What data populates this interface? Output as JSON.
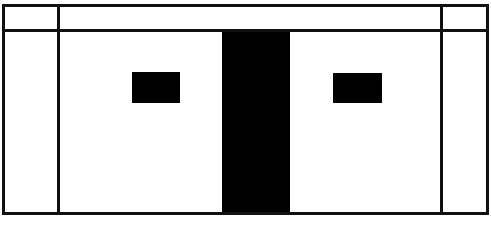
{
  "drawing": {
    "title": "Elevation Line Drawing",
    "type": "technical-line-drawing",
    "style": "monochrome black ink on white",
    "canvas": {
      "width": 491,
      "height": 228,
      "background_color": "#ffffff"
    },
    "ink_color": "#111111",
    "fill_color": "#000000",
    "line_weight": 3,
    "outer_frame": {
      "name": "outer-frame",
      "x": 3,
      "y": 5,
      "width": 484,
      "height": 208,
      "stroke_width": 3,
      "fill": "none"
    },
    "header_rail": {
      "name": "header-rail",
      "y": 30,
      "x1": 3,
      "x2": 487,
      "stroke_width": 3,
      "band_height": 25
    },
    "left_divider": {
      "name": "left-vertical-divider",
      "x": 58,
      "y1": 5,
      "y2": 213,
      "stroke_width": 3
    },
    "right_divider": {
      "name": "right-vertical-divider",
      "x": 441,
      "y1": 5,
      "y2": 213,
      "stroke_width": 3
    },
    "center_column": {
      "name": "center-solid-column",
      "x": 222,
      "y": 31,
      "width": 68,
      "height": 182,
      "fill": "#000000"
    },
    "left_block": {
      "name": "left-solid-block",
      "x": 132,
      "y": 72,
      "width": 48,
      "height": 31,
      "fill": "#000000"
    },
    "right_block": {
      "name": "right-solid-block",
      "x": 333,
      "y": 73,
      "width": 49,
      "height": 30,
      "fill": "#000000"
    },
    "panels": [
      {
        "name": "top-left-header-cell",
        "x": 3,
        "y": 5,
        "width": 55,
        "height": 25
      },
      {
        "name": "top-center-header-cell",
        "x": 58,
        "y": 5,
        "width": 383,
        "height": 25
      },
      {
        "name": "top-right-header-cell",
        "x": 441,
        "y": 5,
        "width": 46,
        "height": 25
      },
      {
        "name": "left-side-panel",
        "x": 3,
        "y": 30,
        "width": 55,
        "height": 183
      },
      {
        "name": "center-left-panel",
        "x": 58,
        "y": 30,
        "width": 164,
        "height": 183
      },
      {
        "name": "center-right-panel",
        "x": 290,
        "y": 30,
        "width": 151,
        "height": 183
      },
      {
        "name": "right-side-panel",
        "x": 441,
        "y": 30,
        "width": 46,
        "height": 183
      }
    ]
  }
}
